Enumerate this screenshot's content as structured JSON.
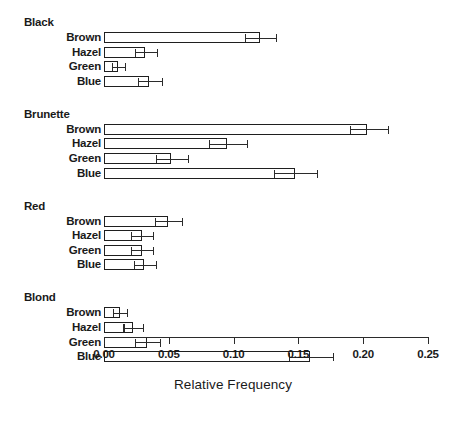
{
  "chart_data": {
    "type": "bar",
    "orientation": "horizontal",
    "title": "",
    "xlabel": "Relative Frequency",
    "ylabel": "",
    "xlim": [
      0.0,
      0.25
    ],
    "xticks": [
      0.0,
      0.05,
      0.1,
      0.15,
      0.2,
      0.25
    ],
    "xticklabels": [
      "0.00",
      "0.05",
      "0.10",
      "0.15",
      "0.20",
      "0.25"
    ],
    "grid": false,
    "legend": false,
    "error_bars": true,
    "groups": [
      {
        "name": "Black",
        "categories": [
          "Brown",
          "Hazel",
          "Green",
          "Blue"
        ],
        "values": [
          0.12,
          0.032,
          0.011,
          0.035
        ],
        "err_low": [
          0.109,
          0.024,
          0.006,
          0.026
        ],
        "err_high": [
          0.133,
          0.041,
          0.016,
          0.045
        ]
      },
      {
        "name": "Brunette",
        "categories": [
          "Brown",
          "Hazel",
          "Green",
          "Blue"
        ],
        "values": [
          0.203,
          0.095,
          0.052,
          0.147
        ],
        "err_low": [
          0.19,
          0.081,
          0.04,
          0.131
        ],
        "err_high": [
          0.219,
          0.11,
          0.065,
          0.164
        ]
      },
      {
        "name": "Red",
        "categories": [
          "Brown",
          "Hazel",
          "Green",
          "Blue"
        ],
        "values": [
          0.049,
          0.029,
          0.029,
          0.031
        ],
        "err_low": [
          0.039,
          0.021,
          0.021,
          0.023
        ],
        "err_high": [
          0.06,
          0.038,
          0.038,
          0.04
        ]
      },
      {
        "name": "Blond",
        "categories": [
          "Brown",
          "Hazel",
          "Green",
          "Blue"
        ],
        "values": [
          0.012,
          0.022,
          0.033,
          0.159
        ],
        "err_low": [
          0.007,
          0.015,
          0.024,
          0.143
        ],
        "err_high": [
          0.018,
          0.03,
          0.043,
          0.177
        ]
      }
    ]
  }
}
